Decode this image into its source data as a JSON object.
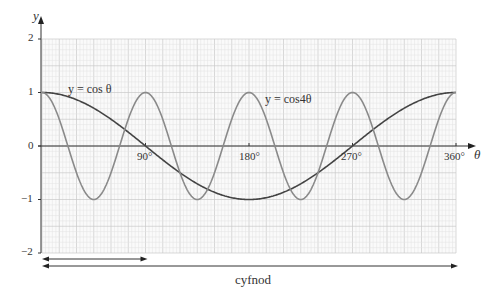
{
  "chart_data": {
    "type": "line",
    "title": "",
    "xlabel": "θ",
    "ylabel": "y",
    "xlim": [
      0,
      360
    ],
    "ylim": [
      -2,
      2
    ],
    "x_ticks": [
      90,
      180,
      270,
      360
    ],
    "x_tick_labels": [
      "90°",
      "180°",
      "270°",
      "360°"
    ],
    "y_ticks": [
      -2,
      -1,
      0,
      1,
      2
    ],
    "y_tick_labels": [
      "−2",
      "−1",
      "0",
      "1",
      "2"
    ],
    "grid": true,
    "series": [
      {
        "name": "y = cos θ",
        "function": "cos(x)",
        "color": "#444444",
        "x": [
          0,
          45,
          90,
          135,
          180,
          225,
          270,
          315,
          360
        ],
        "values": [
          1,
          0.707,
          0,
          -0.707,
          -1,
          -0.707,
          0,
          0.707,
          1
        ]
      },
      {
        "name": "y = cos4θ",
        "function": "cos(4x)",
        "color": "#888888",
        "x": [
          0,
          22.5,
          45,
          67.5,
          90,
          112.5,
          135,
          157.5,
          180,
          202.5,
          225,
          247.5,
          270,
          292.5,
          315,
          337.5,
          360
        ],
        "values": [
          1,
          0,
          -1,
          0,
          1,
          0,
          -1,
          0,
          1,
          0,
          -1,
          0,
          1,
          0,
          -1,
          0,
          1
        ]
      }
    ],
    "annotations": [
      {
        "text": "y = cos θ",
        "near": "curve cos θ"
      },
      {
        "text": "y = cos4θ",
        "near": "curve cos 4θ"
      },
      {
        "text": "cyfnod",
        "meaning": "period arrows under x-axis (short: 0–90°, long: 0–360°)"
      }
    ]
  },
  "labels": {
    "y_axis": "y",
    "x_axis": "θ",
    "origin": "0",
    "y1": "1",
    "y2": "2",
    "yneg1": "−1",
    "yneg2": "−2",
    "x90": "90°",
    "x180": "180°",
    "x270": "270°",
    "x360": "360°",
    "curve1": "y = cos θ",
    "curve2": "y = cos4θ",
    "period": "cyfnod"
  }
}
